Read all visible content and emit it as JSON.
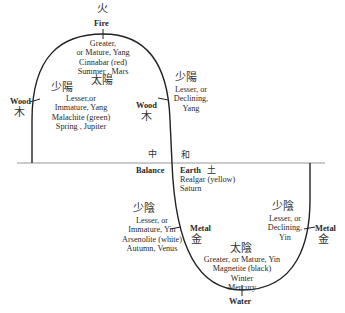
{
  "diagram": {
    "colors": {
      "line": "#222222",
      "axis": "#888888",
      "text": "#2a2a2a"
    },
    "top": {
      "element": "Fire",
      "element_cjk": "火",
      "phase_cjk": "太陽",
      "lines": [
        "Greater,",
        "or Mature, Yang",
        "Cinnabar (red)",
        "Summer , Mars"
      ]
    },
    "upper_left": {
      "element": "Wood",
      "element_cjk": "木",
      "phase_cjk": "少陽",
      "lines": [
        "Lesser,or",
        "Immature, Yang",
        "Malachite (green)",
        "Spring , Jupiter"
      ]
    },
    "upper_right": {
      "element": "Wood",
      "element_cjk": "木",
      "phase_cjk": "少陽",
      "lines": [
        "Lesser, or",
        "Declining,",
        "Yang"
      ]
    },
    "center": {
      "balance_cjk": "中",
      "balance": "Balance",
      "harmony_cjk": "和",
      "earth": "Earth",
      "earth_cjk": "土",
      "lines": [
        "Realgar (yellow)",
        "Saturn"
      ]
    },
    "lower_left": {
      "element": "Metal",
      "element_cjk": "金",
      "phase_cjk": "少陰",
      "lines": [
        "Lesser, or",
        "Immature, Yin",
        "Arsenolite (white)",
        "Autumn, Venus"
      ]
    },
    "lower_right": {
      "element": "Metal",
      "element_cjk": "金",
      "phase_cjk": "少陰",
      "lines": [
        "Lesser, or",
        "Declining,",
        "Yin"
      ]
    },
    "bottom": {
      "element": "Water",
      "phase_cjk": "太陰",
      "lines": [
        "Greater, or Mature, Yin",
        "Magnetite (black)",
        "Winter",
        "Mercury"
      ]
    }
  }
}
